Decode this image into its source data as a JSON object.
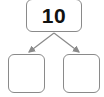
{
  "diagram": {
    "type": "number-bond",
    "whole": {
      "value": "10"
    },
    "parts": [
      {
        "value": ""
      },
      {
        "value": ""
      }
    ],
    "colors": {
      "stroke": "#8a8a8a",
      "text": "#111111",
      "background": "#ffffff"
    }
  }
}
